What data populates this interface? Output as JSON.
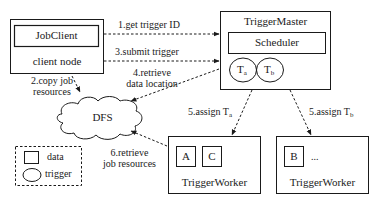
{
  "diagram": {
    "type": "system-architecture",
    "colors": {
      "stroke": "#1a1a1a",
      "background": "#ffffff"
    },
    "nodes": {
      "client_node": {
        "label": "client node",
        "component": "JobClient"
      },
      "trigger_master": {
        "label": "TriggerMaster",
        "component": "Scheduler",
        "triggers": [
          "T",
          "T"
        ],
        "trigger_subs": [
          "a",
          "b"
        ]
      },
      "dfs": {
        "label": "DFS"
      },
      "worker_1": {
        "label": "TriggerWorker",
        "data": [
          "A",
          "C"
        ]
      },
      "worker_2": {
        "label": "TriggerWorker",
        "data": [
          "B"
        ],
        "more": "..."
      }
    },
    "edges": [
      {
        "id": "e1",
        "label": "1.get trigger ID",
        "from": "client_node",
        "to": "trigger_master"
      },
      {
        "id": "e2",
        "label_line1": "2.copy job",
        "label_line2": "resources",
        "from": "client_node",
        "to": "dfs"
      },
      {
        "id": "e3",
        "label": "3.submit trigger",
        "from": "client_node",
        "to": "trigger_master"
      },
      {
        "id": "e4",
        "label_line1": "4.retrieve",
        "label_line2": "data location",
        "from": "trigger_master",
        "to": "dfs"
      },
      {
        "id": "e5a",
        "label": "5.assign T",
        "sub": "a",
        "from": "trigger_master",
        "to": "worker_1"
      },
      {
        "id": "e5b",
        "label": "5.assign T",
        "sub": "b",
        "from": "trigger_master",
        "to": "worker_2"
      },
      {
        "id": "e6",
        "label_line1": "6.retrieve",
        "label_line2": "job resources",
        "from": "worker_1",
        "to": "dfs"
      }
    ],
    "legend": {
      "items": [
        {
          "shape": "square",
          "label": "data"
        },
        {
          "shape": "ellipse",
          "label": "trigger"
        }
      ]
    }
  }
}
